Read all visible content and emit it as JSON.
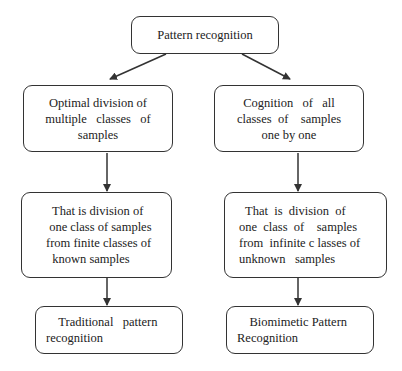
{
  "diagram": {
    "type": "flowchart",
    "nodes": {
      "root": {
        "lines": [
          "Pattern recognition"
        ]
      },
      "left_mid": {
        "lines": [
          "Optimal division of",
          "multiple   classes   of",
          "samples"
        ]
      },
      "right_mid": {
        "lines": [
          "Cognition   of   all",
          "classes  of    samples",
          "one by one"
        ]
      },
      "left_detail": {
        "lines": [
          "  That is division of",
          " one class of samples",
          "from finite classes of",
          "  known samples"
        ]
      },
      "right_detail": {
        "lines": [
          "  That  is  division  of",
          "one  class  of    samples",
          "from  infinite c lasses of",
          "unknown   samples"
        ]
      },
      "left_result": {
        "lines": [
          "    Traditional   pattern",
          "recognition"
        ]
      },
      "right_result": {
        "lines": [
          "    Biomimetic Pattern",
          "Recognition"
        ]
      }
    },
    "edges": [
      {
        "from": "root",
        "to": "left_mid"
      },
      {
        "from": "root",
        "to": "right_mid"
      },
      {
        "from": "left_mid",
        "to": "left_detail"
      },
      {
        "from": "right_mid",
        "to": "right_detail"
      },
      {
        "from": "left_detail",
        "to": "left_result"
      },
      {
        "from": "right_detail",
        "to": "right_result"
      }
    ],
    "colors": {
      "stroke": "#333333",
      "text": "#222222",
      "background": "#ffffff"
    }
  }
}
